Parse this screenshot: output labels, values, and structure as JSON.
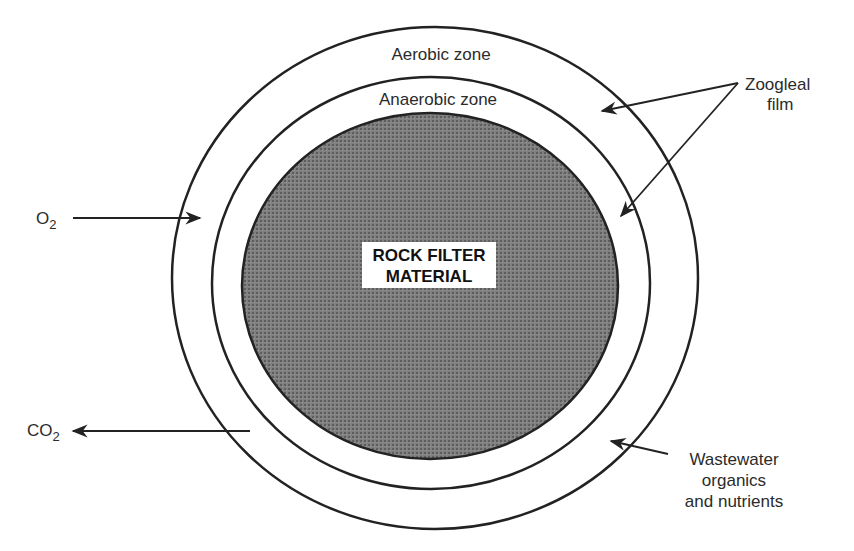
{
  "diagram": {
    "zones": {
      "aerobic": "Aerobic zone",
      "anaerobic": "Anaerobic zone"
    },
    "core": {
      "line1": "ROCK FILTER",
      "line2": "MATERIAL"
    },
    "inputs": {
      "oxygen": "O",
      "oxygen_sub": "2"
    },
    "outputs": {
      "carbon_dioxide": "CO",
      "carbon_dioxide_sub": "2"
    },
    "film_label": {
      "line1": "Zoogleal",
      "line2": "film"
    },
    "wastewater_label": {
      "line1": "Wastewater",
      "line2": "organics",
      "line3": "and nutrients"
    },
    "colors": {
      "stroke": "#222222",
      "core_fill": "#7c7c7c",
      "core_dot": "#5e5e5e",
      "label_bg": "#ffffff",
      "background": "#ffffff"
    }
  }
}
